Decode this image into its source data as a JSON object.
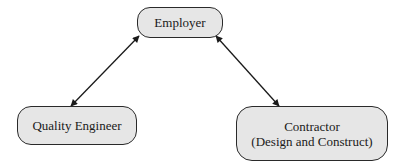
{
  "diagram": {
    "type": "relationship",
    "nodes": [
      {
        "id": "employer",
        "lines": [
          "Employer"
        ]
      },
      {
        "id": "quality_engineer",
        "lines": [
          "Quality Engineer"
        ]
      },
      {
        "id": "contractor",
        "lines": [
          "Contractor",
          "(Design and Construct)"
        ]
      }
    ],
    "edges": [
      {
        "from": "employer",
        "to": "quality_engineer",
        "direction": "bidirectional"
      },
      {
        "from": "employer",
        "to": "contractor",
        "direction": "bidirectional"
      }
    ],
    "colors": {
      "node_fill": "#e6e6e6",
      "node_border": "#2a2a2a",
      "edge": "#1a1a1a",
      "background": "#ffffff"
    }
  }
}
